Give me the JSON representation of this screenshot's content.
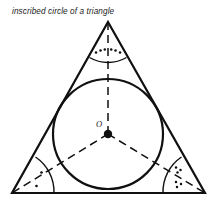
{
  "figure": {
    "caption": "inscribed circle of a triangle",
    "background_color": "#ffffff",
    "stroke_color": "#101010",
    "width": 217,
    "height": 200
  },
  "triangle": {
    "name": "triangle",
    "stroke_color": "#101010",
    "stroke_width": 2.2,
    "fill": "none",
    "vertices": [
      {
        "id": "apex",
        "x": 108,
        "y": 22
      },
      {
        "id": "bottom-right",
        "x": 205,
        "y": 193
      },
      {
        "id": "bottom-left",
        "x": 12,
        "y": 193
      }
    ],
    "points_attr": "108,22 205,193 12,193"
  },
  "incircle": {
    "name": "inscribed-circle",
    "center_x": 108,
    "center_y": 134,
    "radius": 55,
    "stroke_color": "#101010",
    "stroke_width": 2.2,
    "fill": "none"
  },
  "incenter": {
    "name": "incenter-point",
    "x": 108,
    "y": 134,
    "radius": 4.2,
    "fill": "#101010",
    "label": "O",
    "label_x": 99,
    "label_y": 127
  },
  "bisectors": {
    "stroke_color": "#101010",
    "stroke_width": 1.5,
    "dash_pattern": "8,5",
    "segments": [
      {
        "id": "bisector-to-apex",
        "x1": 108,
        "y1": 134,
        "x2": 108,
        "y2": 22
      },
      {
        "id": "bisector-to-bottom-left",
        "x1": 108,
        "y1": 134,
        "x2": 12,
        "y2": 193
      },
      {
        "id": "bisector-to-bottom-right",
        "x1": 108,
        "y1": 134,
        "x2": 205,
        "y2": 193
      }
    ]
  },
  "angle_markers": [
    {
      "id": "angle-marker-apex",
      "vertex": "apex",
      "arc_path": "M 89.5 57.5 A 37 37 0 0 0 126.5 57.5",
      "stroke_color": "#101010",
      "stroke_width": 1.4,
      "dot_count_per_half": 3,
      "dots": [
        {
          "x": 96,
          "y": 52.5,
          "r": 1.25
        },
        {
          "x": 100.5,
          "y": 50.5,
          "r": 1.25
        },
        {
          "x": 104.8,
          "y": 49.6,
          "r": 1.25
        },
        {
          "x": 111.2,
          "y": 49.6,
          "r": 1.25
        },
        {
          "x": 115.5,
          "y": 50.5,
          "r": 1.25
        },
        {
          "x": 120,
          "y": 52.5,
          "r": 1.25
        }
      ]
    },
    {
      "id": "angle-marker-bottom-left",
      "vertex": "bottom-left",
      "arc_path": "M 54 193 A 42 42 0 0 0 35.5 157",
      "stroke_color": "#101010",
      "stroke_width": 1.4,
      "dot_count_per_half": 1,
      "dots": [
        {
          "x": 41.5,
          "y": 172.5,
          "r": 1.35
        },
        {
          "x": 36.5,
          "y": 186,
          "r": 1.35
        }
      ]
    },
    {
      "id": "angle-marker-bottom-right",
      "vertex": "bottom-right",
      "arc_path": "M 163 193 A 42 42 0 0 1 181.5 157",
      "stroke_color": "#101010",
      "stroke_width": 1.4,
      "dot_count_per_half": 3,
      "dots": [
        {
          "x": 176,
          "y": 167.5,
          "r": 1.25
        },
        {
          "x": 180.5,
          "y": 170,
          "r": 1.25
        },
        {
          "x": 177.5,
          "y": 172.5,
          "r": 1.25
        },
        {
          "x": 176,
          "y": 182,
          "r": 1.25
        },
        {
          "x": 181,
          "y": 184,
          "r": 1.25
        },
        {
          "x": 177,
          "y": 187,
          "r": 1.25
        }
      ]
    }
  ]
}
